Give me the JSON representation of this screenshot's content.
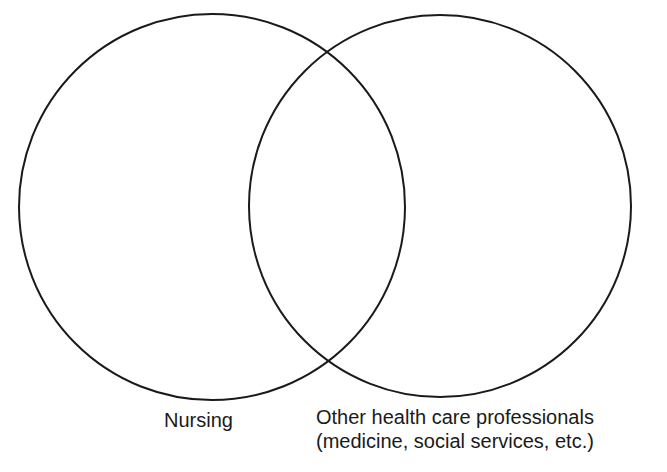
{
  "diagram": {
    "type": "venn",
    "sets": [
      {
        "id": "nursing",
        "label": "Nursing",
        "cx": 212,
        "cy": 207,
        "r": 193
      },
      {
        "id": "other",
        "label_line1": "Other health care professionals",
        "label_line2": "(medicine, social services, etc.)",
        "cx": 440,
        "cy": 206,
        "r": 191
      }
    ],
    "stroke_color": "#1a1a1a",
    "background": "#ffffff"
  }
}
